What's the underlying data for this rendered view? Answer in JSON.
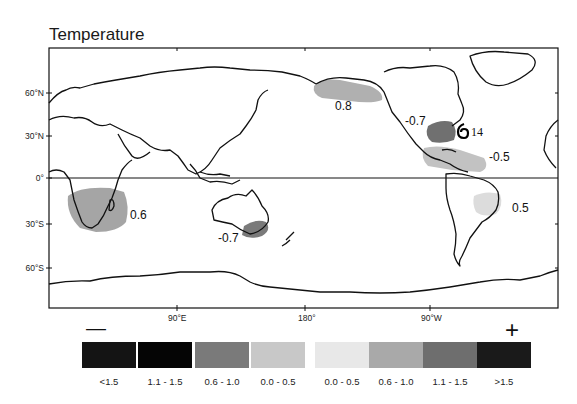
{
  "title": "Temperature",
  "map": {
    "latitude_labels": [
      "60°N",
      "30°N",
      "0°",
      "30°S",
      "60°S"
    ],
    "longitude_labels": [
      "90°E",
      "180°",
      "90°W"
    ],
    "anomalies": [
      {
        "region": "southern-africa",
        "value": "0.6",
        "category": "0.6 - 1.0",
        "sign": "positive"
      },
      {
        "region": "southeast-australia",
        "value": "-0.7",
        "category": "0.6 - 1.0",
        "sign": "negative"
      },
      {
        "region": "alaska",
        "value": "0.8",
        "category": "0.6 - 1.0",
        "sign": "positive"
      },
      {
        "region": "southeast-us",
        "value": "-0.7",
        "category": "1.1 - 1.5",
        "sign": "negative"
      },
      {
        "region": "caribbean-central-america",
        "value": "-0.5",
        "category": "0.6 - 1.0",
        "sign": "negative"
      },
      {
        "region": "eastern-brazil",
        "value": "0.5",
        "category": "0.0 - 0.5",
        "sign": "positive"
      }
    ],
    "storm": {
      "symbol": "hurricane",
      "label": "14"
    }
  },
  "legend": {
    "negative_symbol": "—",
    "positive_symbol": "+",
    "items": [
      {
        "label": "<1.5",
        "color": "#141414"
      },
      {
        "label": "1.1 - 1.5",
        "color": "#050505"
      },
      {
        "label": "0.6 - 1.0",
        "color": "#7a7a7a"
      },
      {
        "label": "0.0 - 0.5",
        "color": "#c8c8c8"
      },
      {
        "label": "0.0 - 0.5",
        "color": "#e8e8e8"
      },
      {
        "label": "0.6 - 1.0",
        "color": "#a9a9a9"
      },
      {
        "label": "1.1 - 1.5",
        "color": "#6e6e6e"
      },
      {
        "label": ">1.5",
        "color": "#1a1a1a"
      }
    ]
  }
}
